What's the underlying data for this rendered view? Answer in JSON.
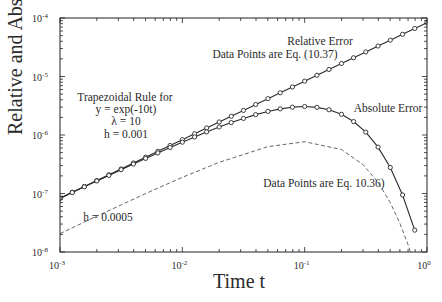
{
  "chart_data": {
    "type": "line",
    "title": "",
    "xlabel": "Time t",
    "ylabel": "Relative and Absolute Errors",
    "xscale": "log",
    "yscale": "log",
    "xlim": [
      0.001,
      1
    ],
    "ylim": [
      1e-08,
      0.0001
    ],
    "grid": false,
    "x_ticks": [
      "10^-3",
      "10^-2",
      "10^-1",
      "10^0"
    ],
    "y_ticks": [
      "10^-8",
      "10^-7",
      "10^-6",
      "10^-5",
      "10^-4"
    ],
    "annotations": [
      {
        "text": "Relative Error",
        "x": 0.09,
        "y": 3.3e-05
      },
      {
        "text": "Data Points are Eq. (10.37)",
        "x": 0.02,
        "y": 2.2e-05
      },
      {
        "text": "Trapezoidal Rule for",
        "x": 0.0018,
        "y": 7.5e-06
      },
      {
        "text": "y = exp(-10t)",
        "x": 0.0025,
        "y": 4.6e-06
      },
      {
        "text": "λ = 10",
        "x": 0.003,
        "y": 2.8e-06
      },
      {
        "text": "h = 0.001",
        "x": 0.0028,
        "y": 1.7e-06
      },
      {
        "text": "Absolute Error",
        "x": 0.3,
        "y": 1.8e-06
      },
      {
        "text": "Data Points are Eq. 10.36)",
        "x": 0.07,
        "y": 2.3e-07
      },
      {
        "text": "h = 0.0005",
        "x": 0.0038,
        "y": 4.3e-08
      }
    ],
    "series": [
      {
        "name": "Relative Error (h = 0.001)",
        "style": "solid",
        "markers": "circle",
        "x": [
          0.001,
          0.00126,
          0.00158,
          0.002,
          0.00251,
          0.00316,
          0.00398,
          0.00501,
          0.00631,
          0.00794,
          0.01,
          0.0126,
          0.0158,
          0.02,
          0.0251,
          0.0316,
          0.0398,
          0.0501,
          0.0631,
          0.0794,
          0.1,
          0.126,
          0.158,
          0.2,
          0.251,
          0.316,
          0.398,
          0.501,
          0.631,
          0.794,
          1.0
        ],
        "values": [
          8.33e-08,
          1.05e-07,
          1.32e-07,
          1.67e-07,
          2.09e-07,
          2.63e-07,
          3.32e-07,
          4.18e-07,
          5.26e-07,
          6.62e-07,
          8.33e-07,
          1.05e-06,
          1.32e-06,
          1.67e-06,
          2.09e-06,
          2.63e-06,
          3.32e-06,
          4.18e-06,
          5.26e-06,
          6.62e-06,
          8.33e-06,
          1.05e-05,
          1.32e-05,
          1.67e-05,
          2.09e-05,
          2.63e-05,
          3.32e-05,
          4.18e-05,
          5.26e-05,
          6.62e-05,
          8.33e-05
        ]
      },
      {
        "name": "Absolute Error (h = 0.001)",
        "style": "solid",
        "markers": "circle",
        "x": [
          0.001,
          0.00126,
          0.00158,
          0.002,
          0.00251,
          0.00316,
          0.00398,
          0.00501,
          0.00631,
          0.00794,
          0.01,
          0.0126,
          0.0158,
          0.02,
          0.0251,
          0.0316,
          0.0398,
          0.0501,
          0.0631,
          0.0794,
          0.1,
          0.126,
          0.158,
          0.2,
          0.251,
          0.316,
          0.398,
          0.501,
          0.631,
          0.794
        ],
        "values": [
          8.25e-08,
          1.04e-07,
          1.3e-07,
          1.64e-07,
          2.04e-07,
          2.55e-07,
          3.19e-07,
          3.98e-07,
          4.94e-07,
          6.11e-07,
          7.54e-07,
          9.27e-07,
          1.13e-06,
          1.37e-06,
          1.63e-06,
          1.92e-06,
          2.23e-06,
          2.53e-06,
          2.8e-06,
          2.99e-06,
          3.07e-06,
          2.97e-06,
          2.7e-06,
          2.26e-06,
          1.7e-06,
          1.12e-06,
          6.21e-07,
          2.78e-07,
          9.43e-08,
          2.36e-08
        ]
      },
      {
        "name": "Absolute Error (h = 0.0005)",
        "style": "dashed",
        "markers": "none",
        "x": [
          0.001,
          0.002,
          0.005,
          0.01,
          0.02,
          0.05,
          0.1,
          0.2,
          0.3,
          0.4,
          0.5,
          0.6,
          0.7,
          0.8
        ],
        "values": [
          2.06e-08,
          4.1e-08,
          9.95e-08,
          1.89e-07,
          3.41e-07,
          6.32e-07,
          7.67e-07,
          5.64e-07,
          3.11e-07,
          1.53e-07,
          7.02e-08,
          3.1e-08,
          1.33e-08,
          5.6e-09
        ]
      }
    ],
    "colors": {
      "line": "#2a2a2a",
      "dashed": "#555555",
      "axis": "#222222",
      "text": "#2a2a2a"
    }
  }
}
